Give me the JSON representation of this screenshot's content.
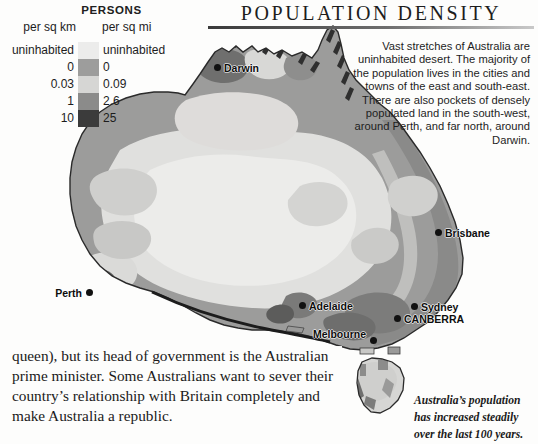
{
  "page": {
    "title": "POPULATION DENSITY",
    "background_color": "#fdfdfc"
  },
  "legend": {
    "heading": "PERSONS",
    "unit_left": "per sq km",
    "unit_right": "per sq mi",
    "rows": [
      {
        "km": "uninhabited",
        "mi": "uninhabited",
        "color": "#ececeb"
      },
      {
        "km": "0",
        "mi": "0",
        "color": "#9d9d9c"
      },
      {
        "km": "0.03",
        "mi": "0.09",
        "color": "#d6d6d4"
      },
      {
        "km": "1",
        "mi": "2.6",
        "color": "#8b8b8a"
      },
      {
        "km": "10",
        "mi": "25",
        "color": "#3b3b3b"
      }
    ]
  },
  "description": {
    "text": "Vast stretches of Australia are uninhabited desert. The majority of the population lives in the cities and towns of the east and south-east. There are also pockets of densely populated land in the south-west, around Perth, and far north, around Darwin."
  },
  "map": {
    "name": "australia-population-density-map",
    "colors": {
      "uninhabited": "#e8e8e6",
      "low": "#d3d3d1",
      "medium": "#9c9c9b",
      "high": "#8a8a89",
      "very_high": "#3d3d3d",
      "coastline": "#2a2a2a",
      "ocean": "#ffffff"
    },
    "cities": [
      {
        "name": "Darwin",
        "label": "Darwin",
        "x": 217,
        "y": 68,
        "label_side": "right"
      },
      {
        "name": "Brisbane",
        "label": "Brisbane",
        "x": 438,
        "y": 232,
        "label_side": "right"
      },
      {
        "name": "Perth",
        "label": "Perth",
        "x": 89,
        "y": 292,
        "label_side": "left"
      },
      {
        "name": "Adelaide",
        "label": "Adelaide",
        "x": 302,
        "y": 305,
        "label_side": "right"
      },
      {
        "name": "Sydney",
        "label": "Sydney",
        "x": 414,
        "y": 306,
        "label_side": "right"
      },
      {
        "name": "Canberra",
        "label": "CANBERRA",
        "x": 397,
        "y": 318,
        "label_side": "right"
      },
      {
        "name": "Melbourne",
        "label": "Melbourne",
        "x": 373,
        "y": 340,
        "label_side": "left"
      }
    ]
  },
  "body_text": {
    "text": "queen), but its head of government is the Australian prime minister. Some Australians want to sever their country’s relationship with Britain completely and make Australia a republic."
  },
  "caption": {
    "text": "Australia’s population has increased steadily over the last 100 years."
  }
}
